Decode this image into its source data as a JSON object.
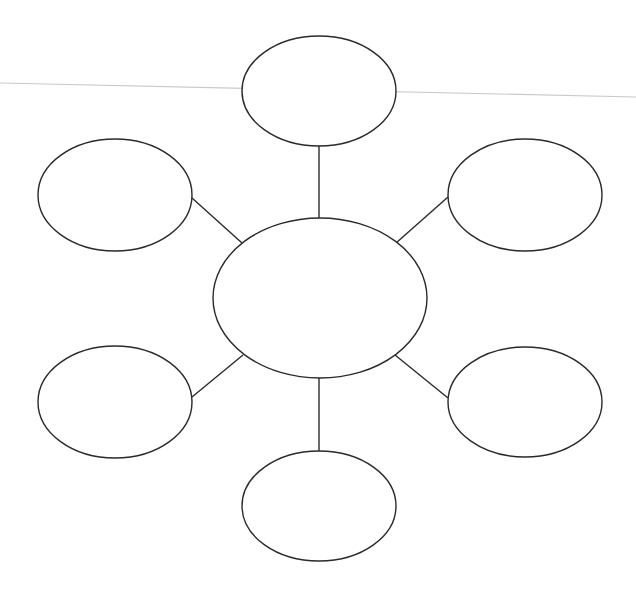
{
  "diagram": {
    "type": "bubble-map",
    "stroke_color": "#2a2a2a",
    "background_color": "#ffffff",
    "artifact_line": {
      "color": "#c9c9c9",
      "x1": 0,
      "y1": 83,
      "x2": 636,
      "y2": 97
    },
    "center": {
      "label": "",
      "cx": 320,
      "cy": 298,
      "rx": 107,
      "ry": 80
    },
    "satellites": [
      {
        "id": "top",
        "label": "",
        "cx": 319,
        "cy": 91,
        "rx": 77,
        "ry": 55
      },
      {
        "id": "top-right",
        "label": "",
        "cx": 525,
        "cy": 195,
        "rx": 77,
        "ry": 56
      },
      {
        "id": "bottom-right",
        "label": "",
        "cx": 525,
        "cy": 402,
        "rx": 77,
        "ry": 55
      },
      {
        "id": "bottom",
        "label": "",
        "cx": 319,
        "cy": 506,
        "rx": 77,
        "ry": 55
      },
      {
        "id": "bottom-left",
        "label": "",
        "cx": 115,
        "cy": 402,
        "rx": 77,
        "ry": 56
      },
      {
        "id": "top-left",
        "label": "",
        "cx": 115,
        "cy": 195,
        "rx": 77,
        "ry": 56
      }
    ],
    "connectors": [
      {
        "id": "top",
        "x1": 319,
        "y1": 146,
        "x2": 319,
        "y2": 219
      },
      {
        "id": "top-right",
        "x1": 448,
        "y1": 197,
        "x2": 396,
        "y2": 243
      },
      {
        "id": "bottom-right",
        "x1": 448,
        "y1": 398,
        "x2": 395,
        "y2": 355
      },
      {
        "id": "bottom",
        "x1": 319,
        "y1": 378,
        "x2": 319,
        "y2": 451
      },
      {
        "id": "bottom-left",
        "x1": 192,
        "y1": 397,
        "x2": 243,
        "y2": 355
      },
      {
        "id": "top-left",
        "x1": 192,
        "y1": 198,
        "x2": 242,
        "y2": 243
      }
    ]
  }
}
